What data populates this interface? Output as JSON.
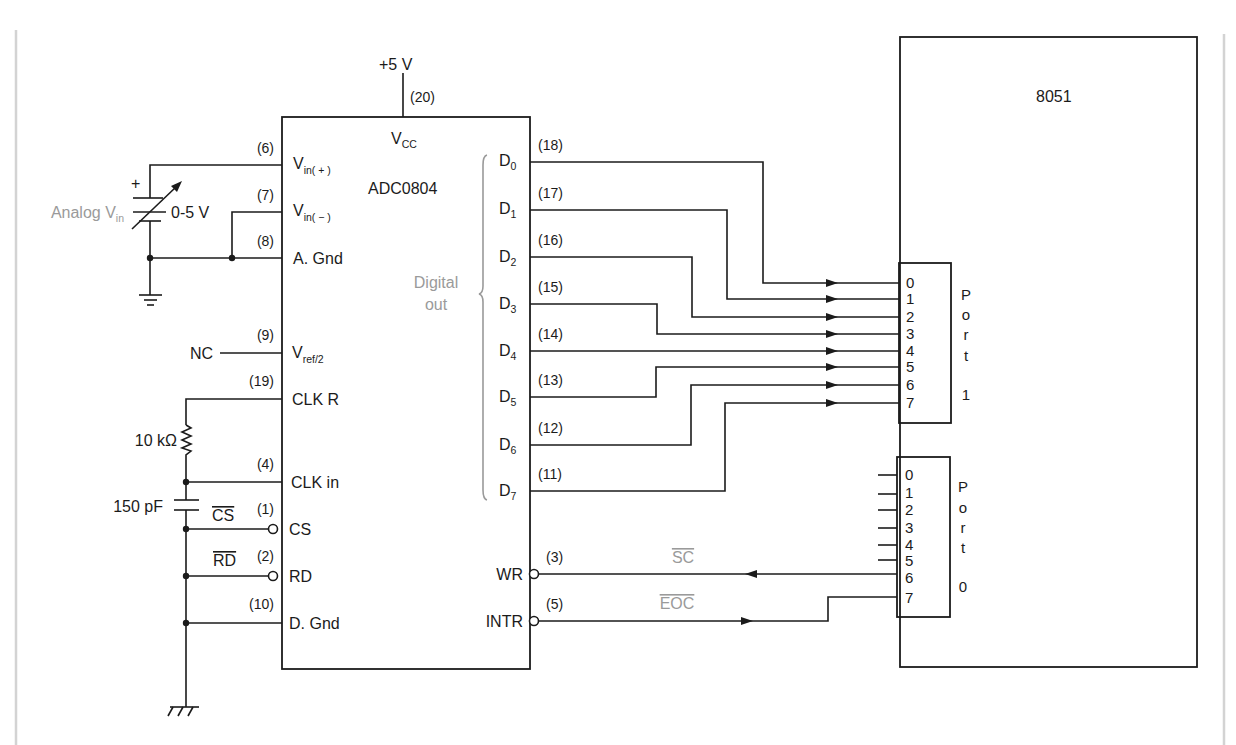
{
  "colors": {
    "line": "#1b1b1b",
    "annotation": "#9a9a9a",
    "frame": "#d3d3d3",
    "background": "#ffffff"
  },
  "adc": {
    "name": "ADC0804",
    "supply": "+5 V",
    "supply_pin": "(20)",
    "vcc": {
      "base": "V",
      "sub": "CC"
    },
    "left_pins": [
      {
        "num": "(6)",
        "label": "V",
        "sub": "in( + )"
      },
      {
        "num": "(7)",
        "label": "V",
        "sub": "in( − )"
      },
      {
        "num": "(8)",
        "label": "A. Gnd"
      },
      {
        "num": "(9)",
        "label": "V",
        "sub": "ref/2"
      },
      {
        "num": "(19)",
        "label": "CLK R"
      },
      {
        "num": "(4)",
        "label": "CLK in"
      },
      {
        "num": "(1)",
        "label": "CS"
      },
      {
        "num": "(2)",
        "label": "RD"
      },
      {
        "num": "(10)",
        "label": "D. Gnd"
      }
    ],
    "data_pins": [
      {
        "num": "(18)",
        "label": "D",
        "sub": "0"
      },
      {
        "num": "(17)",
        "label": "D",
        "sub": "1"
      },
      {
        "num": "(16)",
        "label": "D",
        "sub": "2"
      },
      {
        "num": "(15)",
        "label": "D",
        "sub": "3"
      },
      {
        "num": "(14)",
        "label": "D",
        "sub": "4"
      },
      {
        "num": "(13)",
        "label": "D",
        "sub": "5"
      },
      {
        "num": "(12)",
        "label": "D",
        "sub": "6"
      },
      {
        "num": "(11)",
        "label": "D",
        "sub": "7"
      }
    ],
    "control_pins": [
      {
        "num": "(3)",
        "label": "WR"
      },
      {
        "num": "(5)",
        "label": "INTR"
      }
    ],
    "digital_out": {
      "line1": "Digital",
      "line2": "out"
    }
  },
  "input_circuit": {
    "analog_label": "Analog V",
    "analog_sub": "in",
    "range": "0-5 V",
    "polarity": "+"
  },
  "nc_label": "NC",
  "clock": {
    "resistor": "10 kΩ",
    "capacitor": "150 pF"
  },
  "active_low": {
    "cs": "CS",
    "rd": "RD"
  },
  "signals": {
    "sc": "SC",
    "eoc": "EOC"
  },
  "mcu": {
    "name": "8051",
    "port1": {
      "letters": [
        "P",
        "o",
        "r",
        "t"
      ],
      "number": "1",
      "pins": [
        "0",
        "1",
        "2",
        "3",
        "4",
        "5",
        "6",
        "7"
      ]
    },
    "port0": {
      "letters": [
        "P",
        "o",
        "r",
        "t"
      ],
      "number": "0",
      "pins": [
        "0",
        "1",
        "2",
        "3",
        "4",
        "5",
        "6",
        "7"
      ]
    }
  }
}
